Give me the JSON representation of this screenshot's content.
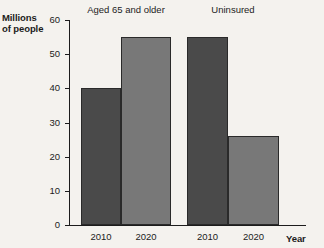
{
  "chart_data": {
    "type": "bar",
    "title": "",
    "xlabel": "Year",
    "ylabel": "Millions\nof people",
    "ylim": [
      0,
      60
    ],
    "ytick_labels": [
      "60",
      "50",
      "40",
      "30",
      "20",
      "10",
      "0"
    ],
    "ytick_values": [
      60,
      50,
      40,
      30,
      20,
      10,
      0
    ],
    "grid": false,
    "legend": "none",
    "groups": [
      {
        "label": "Aged 65 and older",
        "categories": [
          "2010",
          "2020"
        ],
        "values": [
          40,
          55
        ],
        "colors": [
          "#4a4a4a",
          "#787878"
        ]
      },
      {
        "label": "Uninsured",
        "categories": [
          "2010",
          "2020"
        ],
        "values": [
          55,
          26
        ],
        "colors": [
          "#4a4a4a",
          "#787878"
        ]
      }
    ],
    "categories": [
      "2010",
      "2020",
      "2010",
      "2020"
    ],
    "values": [
      40,
      55,
      55,
      26
    ],
    "colors": {
      "dark_bar": "#4a4a4a",
      "light_bar": "#787878",
      "axis": "#1c1c1c",
      "background": "#f4f2ee"
    }
  },
  "bars": [
    {
      "label": "2010",
      "group": "Aged 65 and older",
      "value": 40
    },
    {
      "label": "2020",
      "group": "Aged 65 and older",
      "value": 55
    },
    {
      "label": "2010",
      "group": "Uninsured",
      "value": 55
    },
    {
      "label": "2020",
      "group": "Uninsured",
      "value": 26
    }
  ],
  "ticks": [
    {
      "label": "60"
    },
    {
      "label": "50"
    },
    {
      "label": "40"
    },
    {
      "label": "30"
    },
    {
      "label": "20"
    },
    {
      "label": "10"
    },
    {
      "label": "0"
    }
  ]
}
